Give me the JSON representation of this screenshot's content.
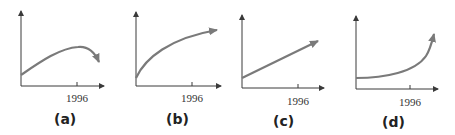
{
  "colors": {
    "axis": "#3a3a3a",
    "curve": "#7a7a7a"
  },
  "panels": [
    {
      "label": "(a)",
      "tick_label": "1996",
      "shape": "rises then falls (peak near 1996)"
    },
    {
      "label": "(b)",
      "tick_label": "1996",
      "shape": "increasing, concave (leveling off)"
    },
    {
      "label": "(c)",
      "tick_label": "1996",
      "shape": "linear increase"
    },
    {
      "label": "(d)",
      "tick_label": "1996",
      "shape": "increasing, convex (exponential growth)"
    }
  ]
}
